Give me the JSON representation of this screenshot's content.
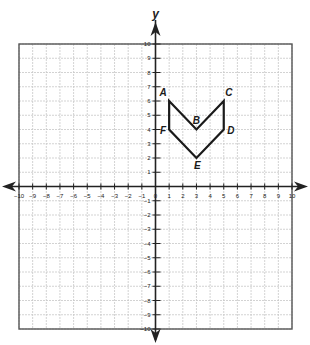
{
  "chart_data": {
    "type": "diagram",
    "title": "",
    "xlabel": "",
    "ylabel": "y",
    "xlim": [
      -10,
      10
    ],
    "ylim": [
      -10,
      10
    ],
    "grid": true,
    "x_ticks": [
      -10,
      -9,
      -8,
      -7,
      -6,
      -5,
      -4,
      -3,
      -2,
      -1,
      0,
      1,
      2,
      3,
      4,
      5,
      6,
      7,
      8,
      9,
      10
    ],
    "y_ticks": [
      -10,
      -9,
      -8,
      -7,
      -6,
      -5,
      -4,
      -3,
      -2,
      -1,
      1,
      2,
      3,
      4,
      5,
      6,
      7,
      8,
      9,
      10
    ],
    "polygon": {
      "order": [
        "A",
        "B",
        "C",
        "D",
        "E",
        "F"
      ],
      "points": [
        {
          "label": "A",
          "x": 1,
          "y": 6
        },
        {
          "label": "B",
          "x": 3,
          "y": 4
        },
        {
          "label": "C",
          "x": 5,
          "y": 6
        },
        {
          "label": "D",
          "x": 5,
          "y": 4
        },
        {
          "label": "E",
          "x": 3,
          "y": 2
        },
        {
          "label": "F",
          "x": 1,
          "y": 4
        }
      ]
    }
  },
  "colors": {
    "grid": "#c8c8c8",
    "border": "#555555",
    "axis": "#222222",
    "shape": "#1a1a1a"
  }
}
